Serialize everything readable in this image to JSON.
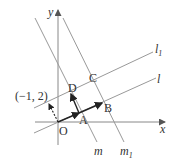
{
  "diagram": {
    "type": "coordinate-geometry",
    "axes": {
      "x_label": "x",
      "y_label": "y",
      "origin_label": "O"
    },
    "points": [
      {
        "name": "O",
        "label": "O"
      },
      {
        "name": "A",
        "label": "A"
      },
      {
        "name": "B",
        "label": "B"
      },
      {
        "name": "C",
        "label": "C"
      },
      {
        "name": "D",
        "label": "D"
      }
    ],
    "coordinate_annotation": "(−1, 2)",
    "lines": [
      {
        "name": "l",
        "label": "l"
      },
      {
        "name": "l1",
        "label": "l",
        "subscript": "1"
      },
      {
        "name": "m",
        "label": "m"
      },
      {
        "name": "m1",
        "label": "m",
        "subscript": "1"
      }
    ],
    "vectors": [
      "O→A",
      "A→B",
      "A→D",
      "O→(−1,2) dashed"
    ],
    "colors": {
      "line": "#888888",
      "vector": "#222222",
      "text": "#333333"
    }
  }
}
